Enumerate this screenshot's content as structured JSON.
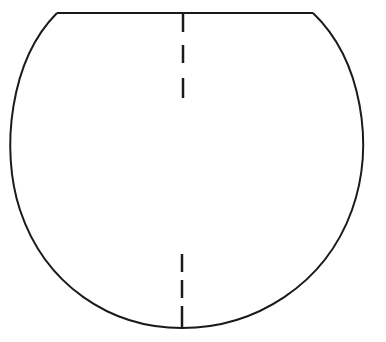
{
  "diagram": {
    "stroke_color": "#1a1a1a",
    "background": "#ffffff",
    "shape": {
      "type": "truncated-circle",
      "chord": {
        "x1": 57,
        "y1": 13,
        "x2": 313,
        "y2": 13
      },
      "arc": {
        "cx": 185,
        "cy": 170,
        "rx": 181,
        "ry": 158
      }
    },
    "axis": {
      "top_dashes": [
        {
          "x": 183,
          "y1": 14,
          "y2": 32
        },
        {
          "x": 183,
          "y1": 45,
          "y2": 63
        },
        {
          "x": 183,
          "y1": 78,
          "y2": 98
        }
      ],
      "bottom_dashes": [
        {
          "x": 182,
          "y1": 254,
          "y2": 272
        },
        {
          "x": 182,
          "y1": 280,
          "y2": 298
        },
        {
          "x": 182,
          "y1": 306,
          "y2": 328
        }
      ]
    }
  }
}
